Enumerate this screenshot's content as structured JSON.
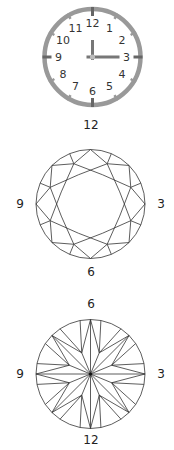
{
  "clock": {
    "numbers": [
      "12",
      "1",
      "2",
      "3",
      "4",
      "5",
      "6",
      "7",
      "8",
      "9",
      "10",
      "11"
    ],
    "time": "3:00",
    "colors": {
      "rim": "#999999",
      "hands": "#777777",
      "text": "#333333"
    }
  },
  "crown_diagram": {
    "label_top": "12",
    "label_left": "9",
    "label_right": "3",
    "label_bottom": "6"
  },
  "pavilion_diagram": {
    "label_top": "6",
    "label_left": "9",
    "label_right": "3",
    "label_bottom": "12"
  }
}
